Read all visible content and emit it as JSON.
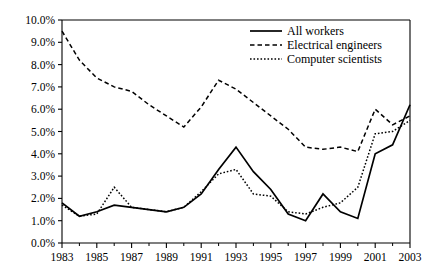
{
  "chart_data": {
    "type": "line",
    "title": "",
    "subtitle": "",
    "xlabel": "",
    "ylabel": "",
    "grid": false,
    "legend_position": "top-right",
    "x": [
      1983,
      1984,
      1985,
      1986,
      1987,
      1988,
      1989,
      1990,
      1991,
      1992,
      1993,
      1994,
      1995,
      1996,
      1997,
      1998,
      1999,
      2000,
      2001,
      2002,
      2003
    ],
    "xlim": [
      1983,
      2003
    ],
    "ylim": [
      0,
      10
    ],
    "y_tick_values": [
      0,
      1,
      2,
      3,
      4,
      5,
      6,
      7,
      8,
      9,
      10
    ],
    "y_tick_labels": [
      "0.0%",
      "1.0%",
      "2.0%",
      "3.0%",
      "4.0%",
      "5.0%",
      "6.0%",
      "7.0%",
      "8.0%",
      "9.0%",
      "10.0%"
    ],
    "x_tick_values": [
      1983,
      1985,
      1987,
      1989,
      1991,
      1993,
      1995,
      1997,
      1999,
      2001,
      2003
    ],
    "x_tick_labels": [
      "1983",
      "1985",
      "1987",
      "1989",
      "1991",
      "1993",
      "1995",
      "1997",
      "1999",
      "2001",
      "2003"
    ],
    "x_minor_tick_values": [
      1984,
      1986,
      1988,
      1990,
      1992,
      1994,
      1996,
      1998,
      2000,
      2002
    ],
    "series": [
      {
        "name": "All workers",
        "style": "solid",
        "color": "#000000",
        "values": [
          1.8,
          1.2,
          1.4,
          1.7,
          1.6,
          1.5,
          1.4,
          1.6,
          2.2,
          3.3,
          4.3,
          3.2,
          2.4,
          1.3,
          1.0,
          2.2,
          1.4,
          1.1,
          4.0,
          4.4,
          6.2
        ]
      },
      {
        "name": "Electrical engineers",
        "style": "dashed",
        "color": "#000000",
        "values": [
          9.5,
          8.2,
          7.4,
          7.0,
          6.8,
          6.2,
          5.7,
          5.2,
          6.1,
          7.3,
          6.9,
          6.3,
          5.7,
          5.1,
          4.3,
          4.2,
          4.3,
          4.1,
          6.0,
          5.3,
          5.7
        ]
      },
      {
        "name": "Computer scientists",
        "style": "dotted",
        "color": "#000000",
        "values": [
          1.7,
          1.2,
          1.3,
          2.5,
          1.6,
          1.5,
          1.4,
          1.6,
          2.3,
          3.1,
          3.3,
          2.2,
          2.1,
          1.4,
          1.3,
          1.6,
          1.8,
          2.5,
          4.9,
          5.0,
          5.5
        ]
      }
    ],
    "legend": [
      {
        "label": "All workers",
        "style": "solid"
      },
      {
        "label": "Electrical engineers",
        "style": "dashed"
      },
      {
        "label": "Computer scientists",
        "style": "dotted"
      }
    ]
  }
}
